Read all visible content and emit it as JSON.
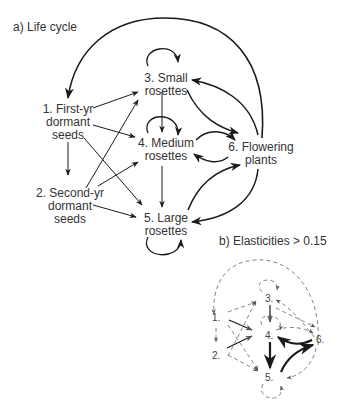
{
  "panel_a": {
    "title": "a) Life cycle",
    "nodes": [
      {
        "id": 1,
        "line1": "1. First-yr",
        "line2": "dormant",
        "line3": "seeds"
      },
      {
        "id": 2,
        "line1": "2. Second-yr",
        "line2": "dormant",
        "line3": "seeds"
      },
      {
        "id": 3,
        "line1": "3. Small",
        "line2": "rosettes"
      },
      {
        "id": 4,
        "line1": "4. Medium",
        "line2": "rosettes"
      },
      {
        "id": 5,
        "line1": "5. Large",
        "line2": "rosettes"
      },
      {
        "id": 6,
        "line1": "6. Flowering",
        "line2": "plants"
      }
    ],
    "edges": [
      "6->1",
      "1->2",
      "1->3",
      "1->4",
      "1->5",
      "2->3",
      "2->4",
      "2->5",
      "3->3",
      "3->4",
      "3->6",
      "6->3",
      "4->4",
      "4->5",
      "4->6",
      "6->4",
      "5->5",
      "5->6",
      "6->5"
    ]
  },
  "panel_b": {
    "title": "b) Elasticities > 0.15",
    "nodes": [
      "1.",
      "2.",
      "3.",
      "4.",
      "5.",
      "6."
    ],
    "strong_edges": [
      "1->4",
      "2->4",
      "3->4",
      "4->5",
      "6->4",
      "5->6"
    ]
  },
  "colors": {
    "line": "#1a1a1a",
    "text": "#333333",
    "dashed": "#777777"
  }
}
